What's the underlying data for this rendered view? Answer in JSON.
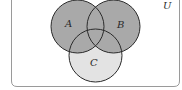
{
  "diagram": {
    "type": "venn",
    "universe_label": "U",
    "sets": [
      {
        "name": "A",
        "label": "A",
        "cx": 77.5,
        "cy": 26.5,
        "r": 26.5
      },
      {
        "name": "B",
        "label": "B",
        "cx": 113.5,
        "cy": 26.5,
        "r": 26.5
      },
      {
        "name": "C",
        "label": "C",
        "cx": 95.5,
        "cy": 55.5,
        "r": 26.5
      }
    ],
    "shaded_region": "A ∪ B",
    "colors": {
      "shaded": "#a9a9a9",
      "c_only": "#e3e3e3",
      "outline": "#2b2b2b",
      "frame": "#9a9a9a",
      "background": "#ffffff"
    }
  }
}
